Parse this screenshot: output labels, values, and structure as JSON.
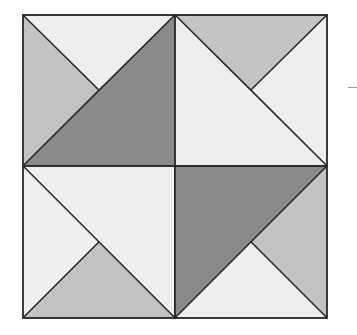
{
  "diagram": {
    "title": "",
    "colors": {
      "dark": "#8a8a8a",
      "medium": "#c3c3c3",
      "light": "#eeeeee",
      "stroke": "#2a2a2a"
    },
    "bounds": {
      "x0": 23,
      "y0": 15,
      "x1": 327,
      "y1": 318,
      "cx": 175,
      "cy": 166
    },
    "quadrants": [
      {
        "name": "top-left",
        "pieces": [
          {
            "shape": "left-triangle",
            "fill": "medium"
          },
          {
            "shape": "top-triangle",
            "fill": "light"
          },
          {
            "shape": "lower-right-half",
            "fill": "dark"
          }
        ]
      },
      {
        "name": "top-right",
        "pieces": [
          {
            "shape": "top-triangle",
            "fill": "medium"
          },
          {
            "shape": "right-triangle",
            "fill": "light"
          },
          {
            "shape": "lower-left-half",
            "fill": "light"
          }
        ]
      },
      {
        "name": "bottom-left",
        "pieces": [
          {
            "shape": "upper-right-half",
            "fill": "light"
          },
          {
            "shape": "left-triangle",
            "fill": "light"
          },
          {
            "shape": "bottom-triangle",
            "fill": "medium"
          }
        ]
      },
      {
        "name": "bottom-right",
        "pieces": [
          {
            "shape": "upper-left-half",
            "fill": "dark"
          },
          {
            "shape": "right-triangle",
            "fill": "medium"
          },
          {
            "shape": "bottom-triangle",
            "fill": "light"
          }
        ]
      }
    ]
  }
}
